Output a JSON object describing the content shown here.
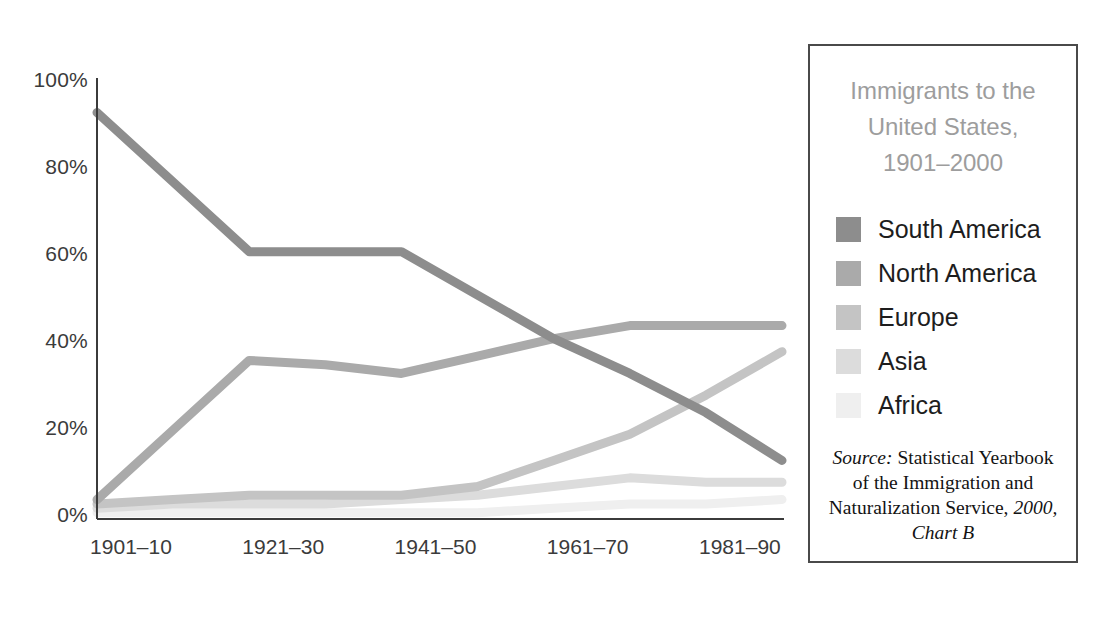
{
  "legend": {
    "title_lines": [
      "Immigrants to the",
      "United States,",
      "1901–2000"
    ],
    "title_color": "#9d9d9d",
    "items": [
      {
        "label": "South America",
        "color": "#8d8d8d"
      },
      {
        "label": "North America",
        "color": "#aaaaaa"
      },
      {
        "label": "Europe",
        "color": "#c4c4c4"
      },
      {
        "label": "Asia",
        "color": "#dcdcdc"
      },
      {
        "label": "Africa",
        "color": "#efefef"
      }
    ],
    "source": {
      "prefix": "Source:",
      "text": " Statistical Yearbook of the Immigration and Naturalization Service, ",
      "tail": "2000, Chart B"
    },
    "border_color": "#4a4a4a"
  },
  "chart_data": {
    "type": "line",
    "xlabel": "",
    "ylabel": "",
    "ylim": [
      0,
      100
    ],
    "yticks": [
      "0%",
      "20%",
      "40%",
      "60%",
      "80%",
      "100%"
    ],
    "ytick_values": [
      0,
      20,
      40,
      60,
      80,
      100
    ],
    "grid": false,
    "legend_position": "right",
    "categories": [
      "1901–10",
      "1911–20",
      "1921–30",
      "1931–40",
      "1941–50",
      "1951–60",
      "1961–70",
      "1971–80",
      "1981–90",
      "1991–2000"
    ],
    "xtick_labels": [
      "1901–10",
      "1921–30",
      "1941–50",
      "1961–70",
      "1981–90"
    ],
    "xtick_indices": [
      0,
      2,
      4,
      6,
      8
    ],
    "series": [
      {
        "name": "South America",
        "color": "#8d8d8d",
        "values": [
          93,
          77,
          61,
          61,
          61,
          51,
          41,
          33,
          24,
          13
        ]
      },
      {
        "name": "North America",
        "color": "#aaaaaa",
        "values": [
          4,
          20,
          36,
          35,
          33,
          37,
          41,
          44,
          44,
          44
        ]
      },
      {
        "name": "Europe",
        "color": "#c4c4c4",
        "values": [
          3,
          4,
          5,
          5,
          5,
          7,
          13,
          19,
          28,
          38
        ]
      },
      {
        "name": "Asia",
        "color": "#dcdcdc",
        "values": [
          2,
          3,
          3,
          3,
          4,
          5,
          7,
          9,
          8,
          8
        ]
      },
      {
        "name": "Africa",
        "color": "#efefef",
        "values": [
          1,
          1,
          1,
          1,
          1,
          1,
          2,
          3,
          3,
          4
        ]
      }
    ],
    "axis_color": "#3b3b3b"
  }
}
